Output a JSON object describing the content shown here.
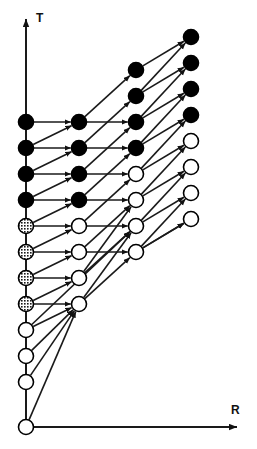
{
  "figure": {
    "type": "state-transition-lattice-diagram",
    "background_color": "#ffffff",
    "line_color": "#1a1a1a",
    "axes": {
      "vertical": {
        "name": "t-axis",
        "label": "T",
        "label_x": 36,
        "label_y": 22,
        "x": 26,
        "y_top": 13,
        "y_bottom": 427,
        "arrow": "up"
      },
      "horizontal": {
        "name": "r-axis",
        "label": "R",
        "label_x": 231,
        "label_y": 414,
        "y": 427,
        "x_left": 26,
        "x_right": 243,
        "arrow": "right"
      }
    },
    "node_styles": {
      "black": {
        "fill": "#000000",
        "stroke": "#000000",
        "name": "filled-node"
      },
      "gray": {
        "fill": "#7a7a7a",
        "stroke": "#000000",
        "name": "hatched-node"
      },
      "white": {
        "fill": "#ffffff",
        "stroke": "#000000",
        "name": "open-node"
      }
    },
    "node_radius": 7.5,
    "columns": [
      {
        "index": 0,
        "x": 26,
        "nodes": [
          {
            "id": "c0r0",
            "y": 122,
            "style": "black"
          },
          {
            "id": "c0r1",
            "y": 148,
            "style": "black"
          },
          {
            "id": "c0r2",
            "y": 174,
            "style": "black"
          },
          {
            "id": "c0r3",
            "y": 200,
            "style": "black"
          },
          {
            "id": "c0r4",
            "y": 226,
            "style": "gray"
          },
          {
            "id": "c0r5",
            "y": 252,
            "style": "gray"
          },
          {
            "id": "c0r6",
            "y": 278,
            "style": "gray"
          },
          {
            "id": "c0r7",
            "y": 304,
            "style": "gray"
          },
          {
            "id": "c0r8",
            "y": 330,
            "style": "white"
          },
          {
            "id": "c0r9",
            "y": 356,
            "style": "white"
          },
          {
            "id": "c0r10",
            "y": 382,
            "style": "white"
          },
          {
            "id": "c0r11",
            "y": 427,
            "style": "white"
          }
        ]
      },
      {
        "index": 1,
        "x": 79,
        "nodes": [
          {
            "id": "c1r0",
            "y": 122,
            "style": "black"
          },
          {
            "id": "c1r1",
            "y": 148,
            "style": "black"
          },
          {
            "id": "c1r2",
            "y": 174,
            "style": "black"
          },
          {
            "id": "c1r3",
            "y": 200,
            "style": "black"
          },
          {
            "id": "c1r4",
            "y": 226,
            "style": "white"
          },
          {
            "id": "c1r5",
            "y": 252,
            "style": "white"
          },
          {
            "id": "c1r6",
            "y": 278,
            "style": "white"
          },
          {
            "id": "c1r7",
            "y": 304,
            "style": "white"
          }
        ]
      },
      {
        "index": 2,
        "x": 136,
        "nodes": [
          {
            "id": "c2r0",
            "y": 70,
            "style": "black"
          },
          {
            "id": "c2r1",
            "y": 96,
            "style": "black"
          },
          {
            "id": "c2r2",
            "y": 122,
            "style": "black"
          },
          {
            "id": "c2r3",
            "y": 148,
            "style": "black"
          },
          {
            "id": "c2r4",
            "y": 174,
            "style": "white"
          },
          {
            "id": "c2r5",
            "y": 200,
            "style": "white"
          },
          {
            "id": "c2r6",
            "y": 226,
            "style": "white"
          },
          {
            "id": "c2r7",
            "y": 252,
            "style": "white"
          }
        ]
      },
      {
        "index": 3,
        "x": 191,
        "nodes": [
          {
            "id": "c3r0",
            "y": 37,
            "style": "black"
          },
          {
            "id": "c3r1",
            "y": 63,
            "style": "black"
          },
          {
            "id": "c3r2",
            "y": 89,
            "style": "black"
          },
          {
            "id": "c3r3",
            "y": 115,
            "style": "black"
          },
          {
            "id": "c3r4",
            "y": 141,
            "style": "white"
          },
          {
            "id": "c3r5",
            "y": 167,
            "style": "white"
          },
          {
            "id": "c3r6",
            "y": 193,
            "style": "white"
          },
          {
            "id": "c3r7",
            "y": 219,
            "style": "white"
          }
        ]
      }
    ],
    "edges": [
      {
        "from": "c0r0",
        "to": "c1r0"
      },
      {
        "from": "c0r1",
        "to": "c1r1"
      },
      {
        "from": "c0r2",
        "to": "c1r2"
      },
      {
        "from": "c0r3",
        "to": "c1r3"
      },
      {
        "from": "c0r4",
        "to": "c1r4"
      },
      {
        "from": "c0r5",
        "to": "c1r5"
      },
      {
        "from": "c0r6",
        "to": "c1r6"
      },
      {
        "from": "c0r7",
        "to": "c1r7"
      },
      {
        "from": "c0r1",
        "to": "c1r0"
      },
      {
        "from": "c0r2",
        "to": "c1r1"
      },
      {
        "from": "c0r3",
        "to": "c1r2"
      },
      {
        "from": "c0r4",
        "to": "c1r3"
      },
      {
        "from": "c0r5",
        "to": "c1r4"
      },
      {
        "from": "c0r6",
        "to": "c1r5"
      },
      {
        "from": "c0r7",
        "to": "c1r6"
      },
      {
        "from": "c0r8",
        "to": "c1r7"
      },
      {
        "from": "c0r8",
        "to": "c2r6"
      },
      {
        "from": "c0r9",
        "to": "c1r7"
      },
      {
        "from": "c0r10",
        "to": "c1r7"
      },
      {
        "from": "c0r11",
        "to": "c1r7"
      },
      {
        "from": "c1r0",
        "to": "c2r2"
      },
      {
        "from": "c1r1",
        "to": "c2r3"
      },
      {
        "from": "c1r2",
        "to": "c2r4"
      },
      {
        "from": "c1r3",
        "to": "c2r5"
      },
      {
        "from": "c1r4",
        "to": "c2r6"
      },
      {
        "from": "c1r5",
        "to": "c2r7"
      },
      {
        "from": "c1r0",
        "to": "c2r0"
      },
      {
        "from": "c1r1",
        "to": "c2r1"
      },
      {
        "from": "c1r2",
        "to": "c2r2"
      },
      {
        "from": "c1r3",
        "to": "c2r3"
      },
      {
        "from": "c1r4",
        "to": "c2r4"
      },
      {
        "from": "c1r5",
        "to": "c2r5"
      },
      {
        "from": "c1r6",
        "to": "c2r6"
      },
      {
        "from": "c1r7",
        "to": "c2r7"
      },
      {
        "from": "c2r0",
        "to": "c3r0"
      },
      {
        "from": "c2r1",
        "to": "c3r1"
      },
      {
        "from": "c2r2",
        "to": "c3r2"
      },
      {
        "from": "c2r3",
        "to": "c3r3"
      },
      {
        "from": "c2r4",
        "to": "c3r4"
      },
      {
        "from": "c2r5",
        "to": "c3r5"
      },
      {
        "from": "c2r6",
        "to": "c3r6"
      },
      {
        "from": "c2r7",
        "to": "c3r7"
      },
      {
        "from": "c2r1",
        "to": "c3r0"
      },
      {
        "from": "c2r2",
        "to": "c3r1"
      },
      {
        "from": "c2r3",
        "to": "c3r2"
      },
      {
        "from": "c2r4",
        "to": "c3r3"
      },
      {
        "from": "c2r5",
        "to": "c3r4"
      },
      {
        "from": "c2r6",
        "to": "c3r5"
      },
      {
        "from": "c2r7",
        "to": "c3r6"
      },
      {
        "from": "c2r7",
        "to": "c3r7"
      },
      {
        "from": "c1r6",
        "to": "c2r5"
      },
      {
        "from": "c1r7",
        "to": "c2r6"
      }
    ]
  }
}
